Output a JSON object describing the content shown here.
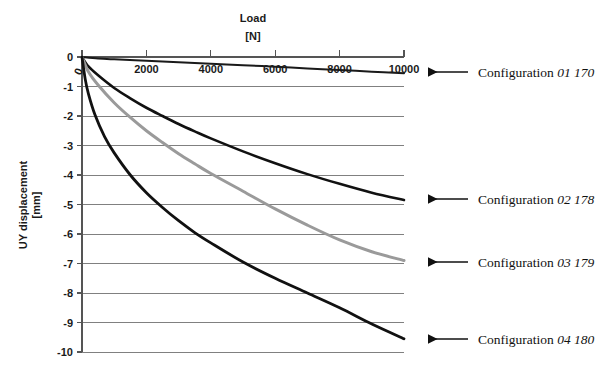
{
  "chart_data": {
    "type": "line",
    "title": "Load",
    "title_unit": "[N]",
    "xlabel": "Load [N]",
    "ylabel": "UY displacement",
    "ylabel_unit": "[mm]",
    "xlim": [
      0,
      10000
    ],
    "ylim": [
      -10,
      0
    ],
    "xticks": [
      0,
      2000,
      4000,
      6000,
      8000,
      10000
    ],
    "xtick_labels": [
      "0",
      "2000",
      "4000",
      "6000",
      "8000",
      "10000"
    ],
    "yticks": [
      0,
      -1,
      -2,
      -3,
      -4,
      -5,
      -6,
      -7,
      -8,
      -9,
      -10
    ],
    "ytick_labels": [
      "0",
      "-1",
      "-2",
      "-3",
      "-4",
      "-5",
      "-6",
      "-7",
      "-8",
      "-9",
      "-10"
    ],
    "grid": true,
    "grid_axis": "y",
    "legend_position": "right-annotations",
    "x_axis_position": "top",
    "series": [
      {
        "name": "Configuration 01 170",
        "label_prefix": "Configuration",
        "label_number": "01 170",
        "color": "#1a1a1a",
        "width": 2.0,
        "x": [
          0,
          500,
          1000,
          2000,
          3000,
          4000,
          5000,
          6000,
          7000,
          8000,
          9000,
          10000
        ],
        "y": [
          0,
          -0.05,
          -0.08,
          -0.13,
          -0.18,
          -0.23,
          -0.28,
          -0.33,
          -0.39,
          -0.44,
          -0.5,
          -0.55
        ]
      },
      {
        "name": "Configuration 02 178",
        "label_prefix": "Configuration",
        "label_number": "02 178",
        "color": "#111111",
        "width": 2.6,
        "x": [
          0,
          200,
          500,
          1000,
          1500,
          2000,
          2500,
          3000,
          3500,
          4000,
          5000,
          6000,
          7000,
          8000,
          9000,
          10000
        ],
        "y": [
          0,
          -0.32,
          -0.62,
          -1.05,
          -1.4,
          -1.72,
          -2.0,
          -2.27,
          -2.52,
          -2.76,
          -3.2,
          -3.6,
          -3.97,
          -4.3,
          -4.6,
          -4.85
        ]
      },
      {
        "name": "Configuration 03 179",
        "label_prefix": "Configuration",
        "label_number": "03 179",
        "color": "#9a9a9a",
        "width": 3.0,
        "x": [
          0,
          200,
          500,
          1000,
          1500,
          2000,
          2500,
          3000,
          3500,
          4000,
          5000,
          6000,
          7000,
          8000,
          9000,
          10000
        ],
        "y": [
          0,
          -0.5,
          -0.95,
          -1.55,
          -2.05,
          -2.5,
          -2.9,
          -3.28,
          -3.62,
          -3.95,
          -4.55,
          -5.15,
          -5.7,
          -6.2,
          -6.6,
          -6.9
        ]
      },
      {
        "name": "Configuration 04 180",
        "label_prefix": "Configuration",
        "label_number": "04 180",
        "color": "#111111",
        "width": 2.8,
        "x": [
          0,
          100,
          200,
          400,
          700,
          1000,
          1500,
          2000,
          2500,
          3000,
          3500,
          4000,
          5000,
          6000,
          7000,
          8000,
          9000,
          10000
        ],
        "y": [
          0,
          -0.75,
          -1.25,
          -1.95,
          -2.7,
          -3.25,
          -4.0,
          -4.6,
          -5.1,
          -5.55,
          -5.95,
          -6.3,
          -6.95,
          -7.5,
          -8.0,
          -8.5,
          -9.05,
          -9.55
        ]
      }
    ],
    "annotations": [
      {
        "target_series": "Configuration 01 170",
        "prefix": "Configuration",
        "number": "01 170"
      },
      {
        "target_series": "Configuration 02 178",
        "prefix": "Configuration",
        "number": "02 178"
      },
      {
        "target_series": "Configuration 03 179",
        "prefix": "Configuration",
        "number": "03 179"
      },
      {
        "target_series": "Configuration 04 180",
        "prefix": "Configuration",
        "number": "04 180"
      }
    ]
  },
  "plot": {
    "left": 82,
    "right": 404,
    "top": 57,
    "bottom": 352,
    "title_x": 253,
    "title_y": 22,
    "title_unit_y": 40,
    "ylabel_x": 27,
    "ylabel_y": 205,
    "annotation_rows": [
      {
        "arrow_x_end": 428,
        "arrow_x_start": 468,
        "y": 72,
        "text_x": 478
      },
      {
        "arrow_x_end": 428,
        "arrow_x_start": 468,
        "y": 199,
        "text_x": 478
      },
      {
        "arrow_x_end": 428,
        "arrow_x_start": 468,
        "y": 262,
        "text_x": 478
      },
      {
        "arrow_x_end": 428,
        "arrow_x_start": 468,
        "y": 339,
        "text_x": 478
      }
    ]
  }
}
